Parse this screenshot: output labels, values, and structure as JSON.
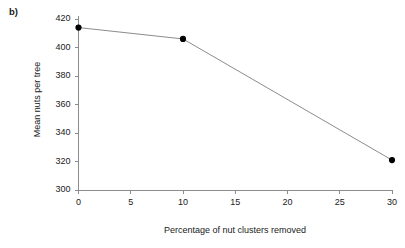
{
  "panel": {
    "label": "b)"
  },
  "chart_data": {
    "type": "line",
    "title": "",
    "subtitle": "",
    "xlabel": "Percentage of nut clusters removed",
    "ylabel": "Mean nuts per tree",
    "x": [
      0,
      10,
      30
    ],
    "values": [
      414,
      406,
      321
    ],
    "series": [
      {
        "name": "Mean nuts per tree",
        "x": [
          0,
          10,
          30
        ],
        "values": [
          414,
          406,
          321
        ]
      }
    ],
    "xlim": [
      0,
      30
    ],
    "ylim": [
      300,
      420
    ],
    "xticks": [
      0,
      5,
      10,
      15,
      20,
      25,
      30
    ],
    "yticks": [
      300,
      320,
      340,
      360,
      380,
      400,
      420
    ],
    "xtick_labels": [
      "0",
      "5",
      "10",
      "15",
      "20",
      "25",
      "30"
    ],
    "ytick_labels": [
      "300",
      "320",
      "340",
      "360",
      "380",
      "400",
      "420"
    ],
    "grid": false,
    "legend": "none",
    "marker": "filled-circle",
    "line_color": "#8c8c8c",
    "marker_color": "#000000",
    "axis_color": "#8c8c8c"
  }
}
